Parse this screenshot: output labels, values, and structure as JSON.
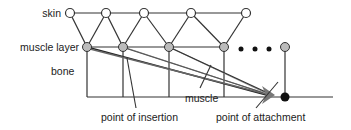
{
  "labels": {
    "skin": "skin",
    "muscle_layer": "muscle layer",
    "bone": "bone",
    "muscle": "muscle",
    "point_of_insertion": "point of insertion",
    "point_of_attachment": "point of attachment"
  },
  "ellipsis": "• • •",
  "colors": {
    "line": "#333333",
    "skin_node_fill": "#ffffff",
    "muscle_node_fill": "#bbbbbb",
    "attachment_node_fill": "#111111",
    "muscle_bundle": "#777777"
  },
  "nodes": {
    "skin": [
      70,
      106,
      144,
      191,
      246
    ],
    "muscle": [
      87,
      123,
      169,
      224,
      285
    ],
    "attachment": [
      285,
      97
    ]
  }
}
